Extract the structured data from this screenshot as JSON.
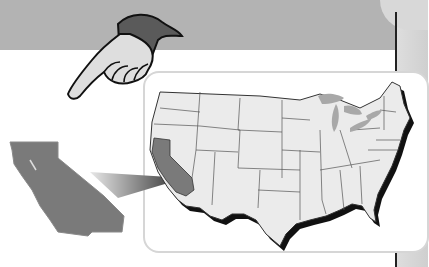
{
  "illustration": {
    "subject": "California highlighted on United States map",
    "highlighted_state": "California",
    "colors": {
      "background": "#ffffff",
      "top_band": "#b3b3b3",
      "side_panel": "#d8d8d8",
      "state_fill": "#ebebeb",
      "highlight_fill": "#7a7a7a",
      "lakes": "#a8a8a8",
      "shadow": "#111111",
      "frame_border": "#d6d6d6"
    }
  }
}
